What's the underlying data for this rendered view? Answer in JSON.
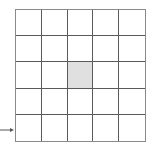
{
  "diagram": {
    "type": "grid",
    "rows": 5,
    "cols": 5,
    "shaded_cells": [
      {
        "row": 3,
        "col": 3
      }
    ],
    "colors": {
      "line": "#5a5a5a",
      "border": "#8a8a8a",
      "shaded": "#e0e0e0",
      "background": "#ffffff"
    },
    "arrow": {
      "direction": "right",
      "points_to_row": 5,
      "icon": "arrow-right-icon"
    }
  }
}
